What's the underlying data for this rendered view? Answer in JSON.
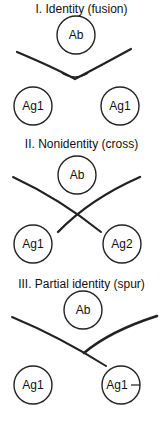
{
  "sections": [
    {
      "title": "I. Identity (fusion)",
      "ab_label": "Ab",
      "left_label": "Ag1",
      "right_label": "Ag1"
    },
    {
      "title": "II. Nonidentity (cross)",
      "ab_label": "Ab",
      "left_label": "Ag1",
      "right_label": "Ag2"
    },
    {
      "title": "III. Partial identity (spur)",
      "ab_label": "Ab",
      "left_label": "Ag1",
      "right_label": "Ag1"
    }
  ],
  "colors": {
    "stroke": "#222222",
    "background": "#ffffff"
  }
}
